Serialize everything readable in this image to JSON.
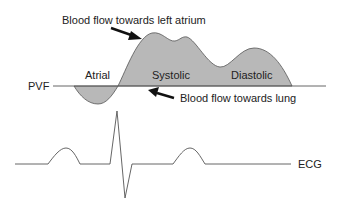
{
  "diagram": {
    "labels": {
      "pvf": "PVF",
      "atrial": "Atrial",
      "systolic": "Systolic",
      "diastolic": "Diastolic",
      "ecg": "ECG",
      "arrow_left_atrium": "Blood flow towards left atrium",
      "arrow_lung": "Blood flow towards lung"
    },
    "colors": {
      "fill": "#b8b8b8",
      "stroke": "#555555",
      "text": "#222222",
      "arrow": "#111111"
    },
    "waves": {
      "pvf": [
        "atrial (below baseline)",
        "systolic (above baseline)",
        "diastolic (above baseline)"
      ],
      "ecg": [
        "P wave",
        "QRS complex",
        "T wave"
      ]
    }
  }
}
